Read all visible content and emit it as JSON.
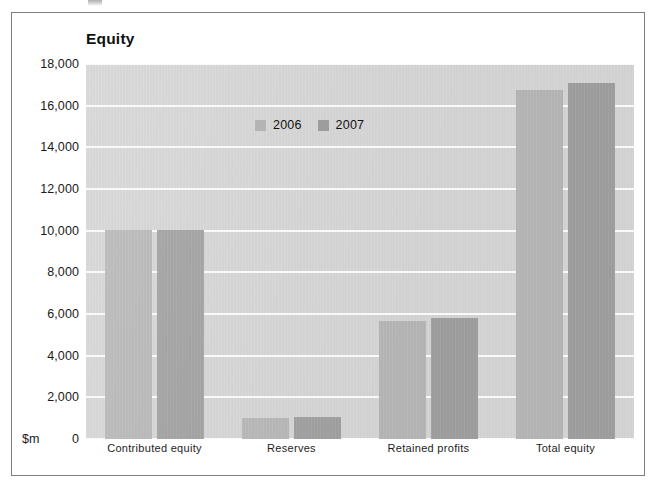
{
  "figure": {
    "title": "Equity",
    "y_unit_label": "$m"
  },
  "legend": {
    "position": "top-center-inside",
    "items": [
      {
        "label": "2006",
        "color": "#b4b4b4",
        "swatch_name": "legend-swatch-2006"
      },
      {
        "label": "2007",
        "color": "#9d9d9d",
        "swatch_name": "legend-swatch-2007"
      }
    ]
  },
  "axis": {
    "y_ticks": [
      "18,000",
      "16,000",
      "14,000",
      "12,000",
      "10,000",
      "8,000",
      "6,000",
      "4,000",
      "2,000",
      "0"
    ],
    "y_tick_values": [
      18000,
      16000,
      14000,
      12000,
      10000,
      8000,
      6000,
      4000,
      2000,
      0
    ],
    "x_categories": [
      "Contributed  equity",
      "Reserves",
      "Retained  profits",
      "Total  equity"
    ]
  },
  "chart_data": {
    "type": "bar",
    "title": "Equity",
    "xlabel": "",
    "ylabel": "$m",
    "ylim": [
      0,
      18000
    ],
    "ytick_step": 2000,
    "grid": true,
    "legend_position": "top-center",
    "categories": [
      "Contributed  equity",
      "Reserves",
      "Retained  profits",
      "Total  equity"
    ],
    "series": [
      {
        "name": "2006",
        "color": "#b4b4b4",
        "values": [
          10050,
          1000,
          5650,
          16750
        ]
      },
      {
        "name": "2007",
        "color": "#9d9d9d",
        "values": [
          10050,
          1080,
          5800,
          17100
        ]
      }
    ]
  },
  "colors": {
    "plot_background": "#d3d3d3",
    "gridline": "#fbfbfb",
    "frame_border": "#7a7d82",
    "page_background": "#ffffff",
    "text": "#111111"
  }
}
